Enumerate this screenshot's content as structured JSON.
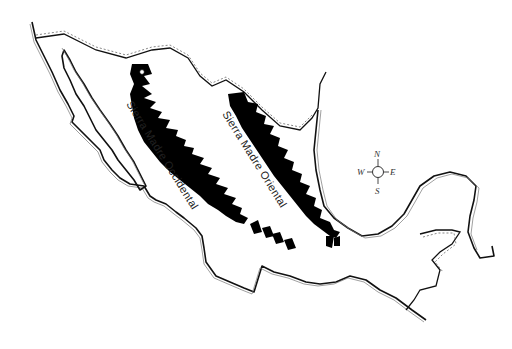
{
  "map": {
    "subject": "Mexico",
    "style": "black-and-white line map",
    "labels": [
      {
        "id": "occidental",
        "text": "Sierra Madre Occidental"
      },
      {
        "id": "oriental",
        "text": "Sierra Madre Oriental"
      }
    ],
    "compass": {
      "north": "N",
      "south": "S",
      "east": "E",
      "west": "W"
    },
    "marker": {
      "type": "open-circle",
      "location": "northern tip of Sierra Madre Occidental"
    },
    "colors": {
      "ink": "#000000",
      "background": "#ffffff"
    }
  }
}
